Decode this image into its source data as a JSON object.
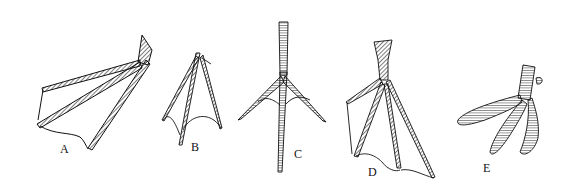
{
  "figure": {
    "background": "#ffffff",
    "ink": "#111111",
    "panels": [
      {
        "id": "A",
        "label": "A",
        "label_pos": [
          60,
          142
        ],
        "description": "webbed foot, palmate, side view"
      },
      {
        "id": "B",
        "label": "B",
        "label_pos": [
          191,
          140
        ],
        "description": "semipalmate / partially webbed foot"
      },
      {
        "id": "C",
        "label": "C",
        "label_pos": [
          294,
          147
        ],
        "description": "unwebbed foot, long toes"
      },
      {
        "id": "D",
        "label": "D",
        "label_pos": [
          368,
          165
        ],
        "description": "totipalmate / webbed foot, front view"
      },
      {
        "id": "E",
        "label": "E",
        "label_pos": [
          483,
          161
        ],
        "description": "lobate foot"
      }
    ]
  }
}
